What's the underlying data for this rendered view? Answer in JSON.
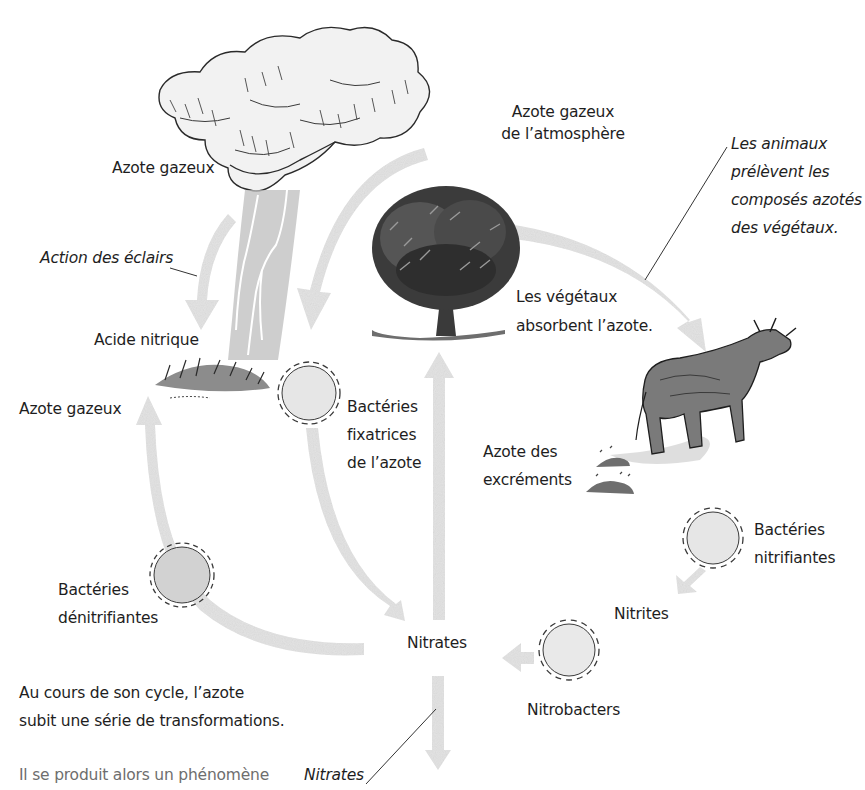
{
  "diagram": {
    "colors": {
      "arrow": "#e3e3e3",
      "bacteria_fill": "#e6e6e6",
      "bacteria_fill_dark": "#d2d2d2",
      "ink": "#1e1e1e",
      "note_text": "#6e6e6e"
    },
    "illustrations": {
      "cloud": "storm-cloud",
      "lightning": "lightning-bolt",
      "grass": "grass-tuft",
      "tree": "tree",
      "cow": "cow",
      "excrement": "dung-piles"
    },
    "labels": {
      "azote_gazeux_cloud": "Azote gazeux",
      "azote_atmosphere_line1": "Azote gazeux",
      "azote_atmosphere_line2": "de l’atmosphère",
      "animaux_line1": "Les animaux",
      "animaux_line2": "prélèvent les",
      "animaux_line3": "composés azotés",
      "animaux_line4": "des végétaux.",
      "action_eclairs": "Action des éclairs",
      "vegetaux_line1": "Les végétaux",
      "vegetaux_line2": "absorbent l’azote.",
      "acide_nitrique": "Acide nitrique",
      "azote_gazeux_left": "Azote gazeux",
      "fixatrices_line1": "Bactéries",
      "fixatrices_line2": "fixatrices",
      "fixatrices_line3": "de l’azote",
      "excrements_line1": "Azote des",
      "excrements_line2": "excréments",
      "nitrifiantes_line1": "Bactéries",
      "nitrifiantes_line2": "nitrifiantes",
      "denitrifiantes_line1": "Bactéries",
      "denitrifiantes_line2": "dénitrifiantes",
      "nitrites": "Nitrites",
      "nitrates_center": "Nitrates",
      "nitrobacters": "Nitrobacters",
      "nitrates_callout": "Nitrates"
    },
    "caption": {
      "line1": "Au cours de son cycle, l’azote",
      "line2": "subit une série de transformations."
    },
    "footnote": "Il se produit alors un phénomène"
  }
}
